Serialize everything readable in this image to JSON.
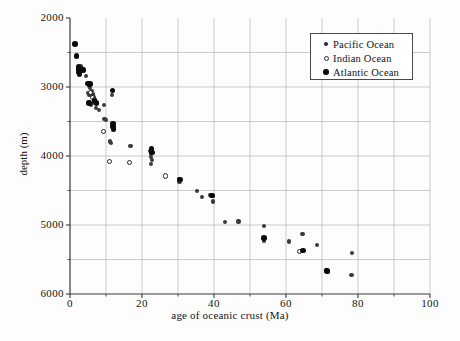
{
  "chart_data": {
    "type": "scatter",
    "title": "",
    "xlabel": "age of oceanic crust (Ma)",
    "ylabel": "depth (m)",
    "xlim": [
      0,
      100
    ],
    "ylim": [
      2000,
      6000
    ],
    "y_inverted": true,
    "xticks": [
      0,
      20,
      40,
      60,
      80,
      100
    ],
    "xtick_labels": [
      "0",
      "20",
      "40",
      "60",
      "80",
      "100"
    ],
    "x_minor_ticks": [
      10,
      30,
      50,
      70,
      90
    ],
    "yticks": [
      2000,
      3000,
      4000,
      5000,
      6000
    ],
    "ytick_labels": [
      "2000",
      "3000",
      "4000",
      "5000",
      "6000"
    ],
    "y_minor_ticks": [
      2500,
      3500,
      4500,
      5500
    ],
    "grid": true,
    "grid_color": "#b5b5b5",
    "legend_position": "top-right",
    "series": [
      {
        "name": "Pacific Ocean",
        "marker": "filled-small-circle",
        "color": "#3a3a3a",
        "points": [
          [
            2.0,
            2550
          ],
          [
            3.0,
            2700
          ],
          [
            3.2,
            2730
          ],
          [
            3.4,
            2760
          ],
          [
            4.4,
            2840
          ],
          [
            5.2,
            2980
          ],
          [
            5.6,
            3010
          ],
          [
            5.0,
            3090
          ],
          [
            5.4,
            3120
          ],
          [
            6.0,
            3060
          ],
          [
            6.4,
            3110
          ],
          [
            6.6,
            3140
          ],
          [
            5.2,
            3220
          ],
          [
            5.8,
            3260
          ],
          [
            6.6,
            3230
          ],
          [
            7.2,
            3300
          ],
          [
            8.0,
            3330
          ],
          [
            9.4,
            3260
          ],
          [
            9.6,
            3460
          ],
          [
            10.0,
            3480
          ],
          [
            11.2,
            3790
          ],
          [
            11.4,
            3810
          ],
          [
            11.6,
            3120
          ],
          [
            11.8,
            3560
          ],
          [
            12.0,
            3600
          ],
          [
            16.8,
            3860
          ],
          [
            22.2,
            3930
          ],
          [
            22.4,
            3970
          ],
          [
            22.6,
            4010
          ],
          [
            22.8,
            4060
          ],
          [
            22.4,
            4120
          ],
          [
            30.2,
            4330
          ],
          [
            30.4,
            4370
          ],
          [
            35.2,
            4510
          ],
          [
            36.6,
            4590
          ],
          [
            39.0,
            4560
          ],
          [
            39.6,
            4580
          ],
          [
            39.8,
            4660
          ],
          [
            43.0,
            4960
          ],
          [
            46.8,
            4950
          ],
          [
            53.8,
            5020
          ],
          [
            53.6,
            5190
          ],
          [
            54.0,
            5230
          ],
          [
            60.8,
            5240
          ],
          [
            64.6,
            5130
          ],
          [
            64.4,
            5380
          ],
          [
            68.6,
            5290
          ],
          [
            71.2,
            5660
          ],
          [
            71.6,
            5680
          ],
          [
            78.4,
            5400
          ],
          [
            78.2,
            5730
          ]
        ]
      },
      {
        "name": "Indian Ocean",
        "marker": "open-circle",
        "color": "#ffffff",
        "points": [
          [
            5.6,
            3080
          ],
          [
            6.2,
            3150
          ],
          [
            6.8,
            3180
          ],
          [
            9.4,
            3640
          ],
          [
            11.0,
            4080
          ],
          [
            16.6,
            4090
          ],
          [
            26.6,
            4290
          ],
          [
            63.8,
            5380
          ]
        ]
      },
      {
        "name": "Atlantic Ocean",
        "marker": "filled-large-circle",
        "color": "#0a0a0a",
        "points": [
          [
            1.4,
            2380
          ],
          [
            1.8,
            2550
          ],
          [
            2.4,
            2700
          ],
          [
            2.5,
            2740
          ],
          [
            2.5,
            2780
          ],
          [
            2.6,
            2820
          ],
          [
            3.8,
            2750
          ],
          [
            5.0,
            2950
          ],
          [
            5.6,
            2960
          ],
          [
            5.2,
            3230
          ],
          [
            6.8,
            3200
          ],
          [
            7.4,
            3230
          ],
          [
            11.8,
            3050
          ],
          [
            11.9,
            3530
          ],
          [
            12.0,
            3570
          ],
          [
            12.1,
            3610
          ],
          [
            22.6,
            3900
          ],
          [
            22.7,
            3950
          ],
          [
            30.6,
            4340
          ],
          [
            39.4,
            4570
          ],
          [
            53.9,
            5190
          ],
          [
            64.7,
            5370
          ],
          [
            71.4,
            5670
          ]
        ]
      }
    ]
  },
  "legend": {
    "items": [
      {
        "label": "Pacific Ocean",
        "marker_name": "pacific-marker-icon"
      },
      {
        "label": "Indian Ocean",
        "marker_name": "indian-marker-icon"
      },
      {
        "label": "Atlantic Ocean",
        "marker_name": "atlantic-marker-icon"
      }
    ]
  }
}
